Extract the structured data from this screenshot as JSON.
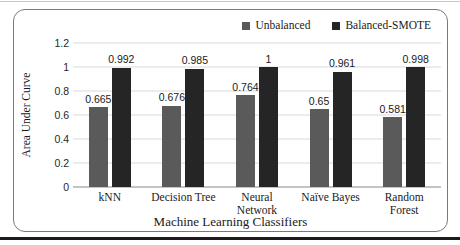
{
  "frame": {
    "panel_border_color": "#7a7a7a",
    "bottom_rule_color": "#1b1b1b",
    "gridline_color": "#d9d9d9",
    "axis_line_color": "#8a8a8a"
  },
  "chart_data": {
    "type": "bar",
    "categories": [
      "kNN",
      "Decision Tree",
      "Neural\nNetwork",
      "Naïve Bayes",
      "Random\nForest"
    ],
    "series": [
      {
        "name": "Unbalanced",
        "color": "#5a5a5a",
        "values": [
          0.665,
          0.676,
          0.764,
          0.65,
          0.581
        ]
      },
      {
        "name": "Balanced-SMOTE",
        "color": "#252525",
        "values": [
          0.992,
          0.985,
          1,
          0.961,
          0.998
        ]
      }
    ],
    "title": "",
    "xlabel": "Machine Learning Classifiers",
    "ylabel": "Area Under Curve",
    "ylim": [
      0,
      1.2
    ],
    "yticks": [
      "0",
      "0.2",
      "0.4",
      "0.6",
      "0.8",
      "1",
      "1.2"
    ],
    "grid": true,
    "legend_position": "top-right",
    "data_labels": true
  }
}
